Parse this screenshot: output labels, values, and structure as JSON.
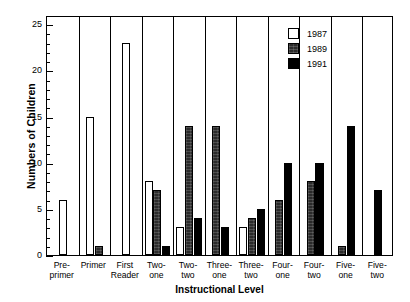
{
  "chart_data": {
    "type": "bar",
    "title": "",
    "xlabel": "Instructional Level",
    "ylabel": "Numbers of Children",
    "ylim": [
      0,
      26
    ],
    "ytick_labels": [
      "0",
      "5",
      "10",
      "15",
      "20",
      "25"
    ],
    "ytick_values": [
      0,
      5,
      10,
      15,
      20,
      25
    ],
    "minor_tick_step": 1,
    "grid": false,
    "legend_position": "top-right",
    "categories": [
      "Pre-primer",
      "Primer",
      "First Reader",
      "Two-one",
      "Two-two",
      "Three-one",
      "Three-two",
      "Four-one",
      "Four-two",
      "Five-one",
      "Five-two"
    ],
    "category_lines": [
      [
        "Pre-",
        "primer"
      ],
      [
        "Primer"
      ],
      [
        "First",
        "Reader"
      ],
      [
        "Two-",
        "one"
      ],
      [
        "Two-",
        "two"
      ],
      [
        "Three-",
        "one"
      ],
      [
        "Three-",
        "two"
      ],
      [
        "Four-",
        "one"
      ],
      [
        "Four-",
        "two"
      ],
      [
        "Five-",
        "one"
      ],
      [
        "Five-",
        "two"
      ]
    ],
    "series": [
      {
        "name": "1987",
        "color": "#ffffff",
        "values": [
          6,
          15,
          23,
          8,
          3,
          0,
          3,
          0,
          0,
          0,
          0
        ]
      },
      {
        "name": "1989",
        "color": "#2b2b2b",
        "values": [
          0,
          1,
          0,
          7,
          14,
          14,
          4,
          6,
          8,
          1,
          0
        ]
      },
      {
        "name": "1991",
        "color": "#000000",
        "values": [
          0,
          0,
          0,
          1,
          4,
          3,
          5,
          10,
          10,
          14,
          7
        ]
      }
    ]
  },
  "legend": {
    "entries": [
      {
        "label": "1987"
      },
      {
        "label": "1989"
      },
      {
        "label": "1991"
      }
    ]
  }
}
